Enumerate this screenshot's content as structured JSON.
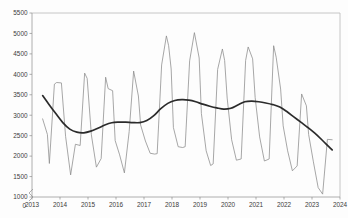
{
  "chart_data": {
    "type": "line",
    "title": "",
    "subtitle": "",
    "xlabel": "",
    "ylabel": "",
    "xlim": [
      2013.0,
      2024.0
    ],
    "ylim": [
      1000,
      5500
    ],
    "y_axis_break": true,
    "y_axis_break_from": 0,
    "y_axis_break_to": 1000,
    "grid": false,
    "legend": "none",
    "y_ticks": [
      1000,
      1500,
      2000,
      2500,
      3000,
      3500,
      4000,
      4500,
      5000,
      5500
    ],
    "y_tick_labels": [
      "1000",
      "1500",
      "2000",
      "2500",
      "3000",
      "3500",
      "4000",
      "4500",
      "5000",
      "5500"
    ],
    "y_origin_label": "0",
    "x_ticks": [
      2013,
      2014,
      2015,
      2016,
      2017,
      2018,
      2019,
      2020,
      2021,
      2022,
      2023,
      2024
    ],
    "x_tick_labels": [
      "2013",
      "2014",
      "2015",
      "2016",
      "2017",
      "2018",
      "2019",
      "2020",
      "2021",
      "2022",
      "2023",
      "2024"
    ],
    "series": [
      {
        "name": "observed",
        "color": "#8a8a8a",
        "x": [
          2013.38,
          2013.55,
          2013.62,
          2013.8,
          2013.88,
          2014.05,
          2014.2,
          2014.38,
          2014.55,
          2014.72,
          2014.88,
          2014.97,
          2015.12,
          2015.3,
          2015.47,
          2015.63,
          2015.72,
          2015.88,
          2015.97,
          2016.13,
          2016.3,
          2016.47,
          2016.63,
          2016.8,
          2016.88,
          2017.05,
          2017.22,
          2017.38,
          2017.47,
          2017.63,
          2017.8,
          2017.88,
          2017.97,
          2018.05,
          2018.22,
          2018.38,
          2018.47,
          2018.63,
          2018.8,
          2018.97,
          2019.05,
          2019.22,
          2019.38,
          2019.47,
          2019.63,
          2019.8,
          2019.88,
          2019.97,
          2020.13,
          2020.3,
          2020.47,
          2020.63,
          2020.72,
          2020.88,
          2020.97,
          2021.13,
          2021.3,
          2021.47,
          2021.63,
          2021.72,
          2021.88,
          2021.97,
          2022.13,
          2022.3,
          2022.47,
          2022.63,
          2022.8,
          2022.88,
          2023.05,
          2023.22,
          2023.38,
          2023.55,
          2023.72
        ],
        "y": [
          2910,
          2530,
          1820,
          3760,
          3800,
          3790,
          2480,
          1540,
          2290,
          2260,
          4030,
          3900,
          2520,
          1730,
          1940,
          3930,
          3650,
          3600,
          2380,
          2030,
          1590,
          2600,
          4080,
          3470,
          2760,
          2370,
          2070,
          2050,
          2060,
          4230,
          4940,
          4700,
          4130,
          2700,
          2230,
          2210,
          2230,
          4330,
          5020,
          4400,
          3040,
          2130,
          1770,
          1810,
          4120,
          4620,
          4340,
          3420,
          2400,
          1900,
          1930,
          4340,
          4670,
          4380,
          3430,
          2470,
          1880,
          1930,
          4700,
          4420,
          3640,
          2740,
          2130,
          1640,
          1760,
          3520,
          3230,
          2530,
          1860,
          1230,
          1070,
          2410,
          2400
        ]
      },
      {
        "name": "trend",
        "color": "#2b2b2b",
        "x": [
          2013.38,
          2013.6,
          2013.85,
          2014.1,
          2014.35,
          2014.6,
          2014.85,
          2015.1,
          2015.35,
          2015.6,
          2015.85,
          2016.1,
          2016.35,
          2016.6,
          2016.85,
          2017.1,
          2017.35,
          2017.6,
          2017.85,
          2018.1,
          2018.35,
          2018.6,
          2018.85,
          2019.1,
          2019.35,
          2019.6,
          2019.85,
          2020.1,
          2020.35,
          2020.6,
          2020.85,
          2021.1,
          2021.35,
          2021.6,
          2021.85,
          2022.1,
          2022.35,
          2022.6,
          2022.85,
          2023.1,
          2023.35,
          2023.6,
          2023.72
        ],
        "y": [
          3480,
          3270,
          3040,
          2820,
          2660,
          2585,
          2570,
          2610,
          2680,
          2760,
          2815,
          2830,
          2830,
          2820,
          2820,
          2870,
          2990,
          3160,
          3290,
          3360,
          3380,
          3370,
          3330,
          3270,
          3220,
          3180,
          3150,
          3170,
          3250,
          3330,
          3345,
          3330,
          3300,
          3260,
          3200,
          3090,
          2960,
          2830,
          2700,
          2560,
          2400,
          2230,
          2150
        ]
      }
    ]
  },
  "axes": {
    "plot_left": 32,
    "plot_right": 340,
    "plot_top": 13,
    "plot_bottom": 197
  }
}
